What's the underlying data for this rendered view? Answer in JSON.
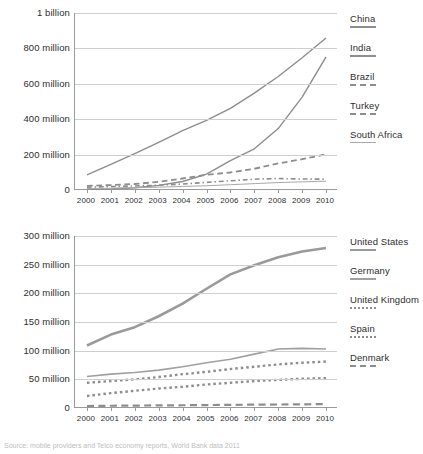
{
  "caption": "Source: mobile providers and Telco economy reports, World Bank data 2011",
  "chart_data": [
    {
      "id": "emerging-markets",
      "type": "line",
      "title": "",
      "xlabel": "",
      "ylabel": "",
      "grid": true,
      "legend_position": "right",
      "x": [
        2000,
        2001,
        2002,
        2003,
        2004,
        2005,
        2006,
        2007,
        2008,
        2009,
        2010
      ],
      "xtick_labels": [
        "2000",
        "2001",
        "2002",
        "2003",
        "2004",
        "2005",
        "2006",
        "2007",
        "2008",
        "2009",
        "2010"
      ],
      "ylim": [
        0,
        1000000000
      ],
      "ytick_values": [
        0,
        200000000,
        400000000,
        600000000,
        800000000,
        1000000000
      ],
      "ytick_labels": [
        "0",
        "200 million",
        "400 million",
        "600 million",
        "800 million",
        "1 billion"
      ],
      "series": [
        {
          "name": "China",
          "style": "solid",
          "color": "#8d8d8d",
          "width": 1.4,
          "values": [
            85000000,
            145000000,
            206000000,
            269000000,
            335000000,
            393000000,
            461000000,
            547000000,
            641000000,
            747000000,
            859000000
          ]
        },
        {
          "name": "India",
          "style": "solid",
          "color": "#8d8d8d",
          "width": 1.4,
          "values": [
            4000000,
            6000000,
            13000000,
            26000000,
            48000000,
            90000000,
            166000000,
            233000000,
            347000000,
            525000000,
            752000000
          ]
        },
        {
          "name": "Brazil",
          "style": "dashed",
          "color": "#8d8d8d",
          "width": 1.8,
          "values": [
            23000000,
            28000000,
            34000000,
            46000000,
            65000000,
            86000000,
            99000000,
            120000000,
            150000000,
            174000000,
            202000000
          ]
        },
        {
          "name": "Turkey",
          "style": "dashdot",
          "color": "#8d8d8d",
          "width": 1.6,
          "values": [
            16000000,
            19000000,
            23000000,
            27000000,
            34000000,
            43000000,
            52000000,
            61000000,
            65000000,
            62000000,
            61000000
          ]
        },
        {
          "name": "South Africa",
          "style": "solid-thin",
          "color": "#a8a8a8",
          "width": 1,
          "values": [
            8000000,
            10000000,
            13000000,
            16000000,
            20000000,
            24000000,
            30000000,
            36000000,
            42000000,
            46000000,
            50000000
          ]
        }
      ]
    },
    {
      "id": "developed-markets",
      "type": "line",
      "title": "",
      "xlabel": "",
      "ylabel": "",
      "grid": true,
      "legend_position": "right",
      "x": [
        2000,
        2001,
        2002,
        2003,
        2004,
        2005,
        2006,
        2007,
        2008,
        2009,
        2010
      ],
      "xtick_labels": [
        "2000",
        "2001",
        "2002",
        "2003",
        "2004",
        "2005",
        "2006",
        "2007",
        "2008",
        "2009",
        "2010"
      ],
      "ylim": [
        0,
        300000000
      ],
      "ytick_values": [
        0,
        50000000,
        100000000,
        150000000,
        200000000,
        250000000,
        300000000
      ],
      "ytick_labels": [
        "0",
        "50 million",
        "100 million",
        "150 million",
        "200 million",
        "250 million",
        "300 million"
      ],
      "series": [
        {
          "name": "United States",
          "style": "solid-thick",
          "color": "#9a9a9a",
          "width": 2.6,
          "values": [
            109000000,
            128000000,
            141000000,
            160000000,
            182000000,
            208000000,
            233000000,
            249000000,
            263000000,
            273000000,
            279000000
          ]
        },
        {
          "name": "Germany",
          "style": "solid",
          "color": "#a0a0a0",
          "width": 1.6,
          "values": [
            55000000,
            59000000,
            62000000,
            66000000,
            72000000,
            79000000,
            85000000,
            94000000,
            103000000,
            104000000,
            103000000
          ]
        },
        {
          "name": "United Kingdom",
          "style": "dotted",
          "color": "#8d8d8d",
          "width": 2.4,
          "values": [
            44000000,
            47000000,
            50000000,
            54000000,
            59000000,
            63000000,
            68000000,
            72000000,
            76000000,
            79000000,
            81000000
          ]
        },
        {
          "name": "Spain",
          "style": "dotted",
          "color": "#8d8d8d",
          "width": 2.4,
          "values": [
            21000000,
            26000000,
            30000000,
            34000000,
            37000000,
            41000000,
            44000000,
            47000000,
            49000000,
            51000000,
            52000000
          ]
        },
        {
          "name": "Denmark",
          "style": "dashed",
          "color": "#8d8d8d",
          "width": 2.2,
          "values": [
            3500000,
            3900000,
            4200000,
            4500000,
            4800000,
            5100000,
            5500000,
            5800000,
            6100000,
            6400000,
            6800000
          ]
        }
      ]
    }
  ]
}
